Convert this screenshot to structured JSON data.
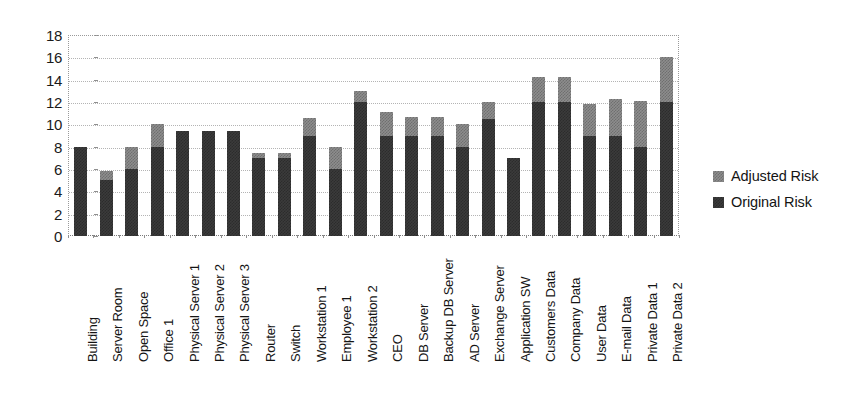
{
  "chart_data": {
    "type": "bar",
    "stacked": true,
    "title": "",
    "subtitle": "",
    "xlabel": "",
    "ylabel": "",
    "ylim": [
      0,
      18
    ],
    "ytick_step": 2,
    "ytick_labels": [
      "18",
      "16",
      "14",
      "12",
      "10",
      "8",
      "6",
      "4",
      "2",
      "0"
    ],
    "ytick_values": [
      18,
      16,
      14,
      12,
      10,
      8,
      6,
      4,
      2,
      0
    ],
    "grid": true,
    "grid_axis": "y",
    "legend_position": "right",
    "categories": [
      "Building",
      "Server Room",
      "Open Space",
      "Office 1",
      "Physical Server 1",
      "Physical Server 2",
      "Physical Server 3",
      "Router",
      "Switch",
      "Workstation 1",
      "Employee 1",
      "Workstation 2",
      "CEO",
      "DB Server",
      "Backup DB Server",
      "AD Server",
      "Exchange Server",
      "Application SW",
      "Customers Data",
      "Company Data",
      "User Data",
      "E-mail Data",
      "Private Data 1",
      "Private Data 2"
    ],
    "series": [
      {
        "name": "Original Risk",
        "color": "#3b3b3b",
        "values": [
          8.0,
          5.0,
          6.0,
          8.0,
          9.4,
          9.4,
          9.4,
          7.0,
          7.0,
          9.0,
          6.0,
          12.0,
          9.0,
          9.0,
          9.0,
          8.0,
          10.5,
          7.0,
          12.0,
          12.0,
          9.0,
          9.0,
          8.0,
          12.0
        ]
      },
      {
        "name": "Adjusted Risk",
        "color": "#8d8d8d",
        "values": [
          0.0,
          0.8,
          2.0,
          2.0,
          0.0,
          0.0,
          0.0,
          0.4,
          0.4,
          1.6,
          2.0,
          1.0,
          2.1,
          1.7,
          1.7,
          2.0,
          1.5,
          0.0,
          2.2,
          2.2,
          2.8,
          3.3,
          4.1,
          4.0
        ]
      }
    ],
    "totals": [
      8.0,
      5.8,
      8.0,
      10.0,
      9.4,
      9.4,
      9.4,
      7.4,
      7.4,
      10.6,
      8.0,
      13.0,
      11.1,
      10.7,
      10.7,
      10.0,
      12.0,
      7.0,
      14.2,
      14.2,
      11.8,
      12.3,
      12.1,
      16.0
    ]
  },
  "legend": {
    "entries": [
      {
        "label": "Adjusted Risk",
        "swatch": "adjusted"
      },
      {
        "label": "Original Risk",
        "swatch": "original"
      }
    ]
  }
}
